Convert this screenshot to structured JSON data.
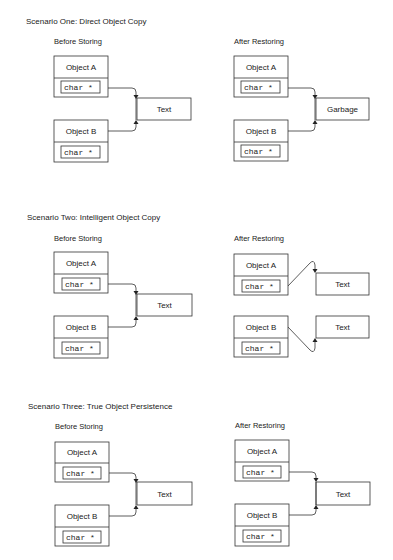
{
  "figure": {
    "scenarios": [
      {
        "title": "Scenario One: Direct Object Copy",
        "before": {
          "label": "Before Storing",
          "object_a": "Object A",
          "object_b": "Object B",
          "field": "char *",
          "target": "Text"
        },
        "after": {
          "label": "After Restoring",
          "object_a": "Object A",
          "object_b": "Object B",
          "field": "char *",
          "target": "Garbage"
        }
      },
      {
        "title": "Scenario Two: Intelligent Object Copy",
        "before": {
          "label": "Before Storing",
          "object_a": "Object A",
          "object_b": "Object B",
          "field": "char *",
          "target": "Text"
        },
        "after": {
          "label": "After Restoring",
          "object_a": "Object A",
          "object_b": "Object B",
          "field": "char *",
          "target_a": "Text",
          "target_b": "Text"
        }
      },
      {
        "title": "Scenario Three: True Object Persistence",
        "before": {
          "label": "Before Storing",
          "object_a": "Object A",
          "object_b": "Object B",
          "field": "char *",
          "target": "Text"
        },
        "after": {
          "label": "After Restoring",
          "object_a": "Object A",
          "object_b": "Object B",
          "field": "char *",
          "target": "Text"
        }
      }
    ]
  }
}
